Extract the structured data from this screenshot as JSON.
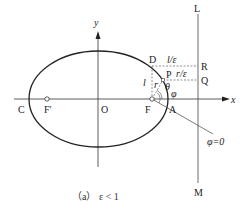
{
  "figure": {
    "caption": "（a） ε < 1",
    "caption_parts": {
      "tag": "（a）",
      "condition": "ε < 1"
    }
  },
  "axes": {
    "x_label": "x",
    "y_label": "y",
    "origin_label": "O"
  },
  "points": {
    "C": "C",
    "F_prime": "F′",
    "O": "O",
    "F": "F",
    "A": "A",
    "D": "D",
    "P": "P",
    "R": "R",
    "Q": "Q",
    "L": "L",
    "M": "M"
  },
  "annotations": {
    "l_over_eps": "l/ε",
    "r_over_eps": "r/ε",
    "l": "l",
    "r": "r",
    "theta": "θ",
    "phi": "φ",
    "phi_zero": "φ=0"
  },
  "colors": {
    "stroke": "#222222",
    "thin": "#444444",
    "background": "#ffffff"
  }
}
